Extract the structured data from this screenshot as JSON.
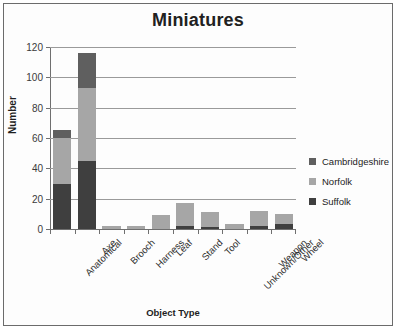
{
  "chart_data": {
    "type": "bar",
    "stacked": true,
    "title": "Miniatures",
    "xlabel": "Object Type",
    "ylabel": "Number",
    "ylim": [
      0,
      120
    ],
    "yticks": [
      0,
      20,
      40,
      60,
      80,
      100,
      120
    ],
    "grid": true,
    "legend_position": "right",
    "categories": [
      "Anatomical",
      "Axe",
      "Brooch",
      "Harness",
      "Leaf",
      "Stand",
      "Tool",
      "Unknown/Other",
      "Weapon",
      "Wheel"
    ],
    "series": [
      {
        "name": "Suffolk",
        "color": "#3f3f3f",
        "values": [
          30,
          45,
          0,
          0,
          0,
          2,
          1,
          0,
          2,
          3
        ]
      },
      {
        "name": "Norfolk",
        "color": "#a6a6a6",
        "values": [
          30,
          48,
          2,
          2,
          9,
          15,
          10,
          3,
          10,
          7
        ]
      },
      {
        "name": "Cambridgeshire",
        "color": "#5f5f5f",
        "values": [
          5,
          23,
          0,
          0,
          0,
          0,
          0,
          0,
          0,
          0
        ]
      }
    ],
    "totals": [
      65,
      116,
      2,
      2,
      9,
      17,
      11,
      3,
      12,
      10
    ],
    "legend_entries": [
      "Cambridgeshire",
      "Norfolk",
      "Suffolk"
    ]
  },
  "colors": {
    "suffolk": "#3f3f3f",
    "norfolk": "#a6a6a6",
    "cambridgeshire": "#5f5f5f",
    "frame_border": "#6b6b6b",
    "gridline": "#9a9a9a",
    "axis": "#6f6f6f",
    "background": "#fdfdfd"
  }
}
